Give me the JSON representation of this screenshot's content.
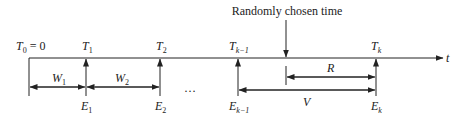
{
  "diagram": {
    "title_annotation": "Randomly chosen time",
    "axis_label": "t",
    "origin_label": {
      "base": "T",
      "sub": "0",
      "suffix": " = 0"
    },
    "events": [
      {
        "T": {
          "base": "T",
          "sub": "1"
        },
        "E": {
          "base": "E",
          "sub": "1"
        }
      },
      {
        "T": {
          "base": "T",
          "sub": "2"
        },
        "E": {
          "base": "E",
          "sub": "2"
        }
      },
      {
        "T": {
          "base": "T",
          "sub": "k−1"
        },
        "E": {
          "base": "E",
          "sub": "k−1"
        }
      },
      {
        "T": {
          "base": "T",
          "sub": "k"
        },
        "E": {
          "base": "E",
          "sub": "k"
        }
      }
    ],
    "intervals": [
      {
        "base": "W",
        "sub": "1"
      },
      {
        "base": "W",
        "sub": "2"
      },
      {
        "base": "R",
        "sub": ""
      },
      {
        "base": "V",
        "sub": ""
      }
    ],
    "ellipsis": "…",
    "colors": {
      "line": "#222222",
      "background": "#ffffff"
    }
  }
}
